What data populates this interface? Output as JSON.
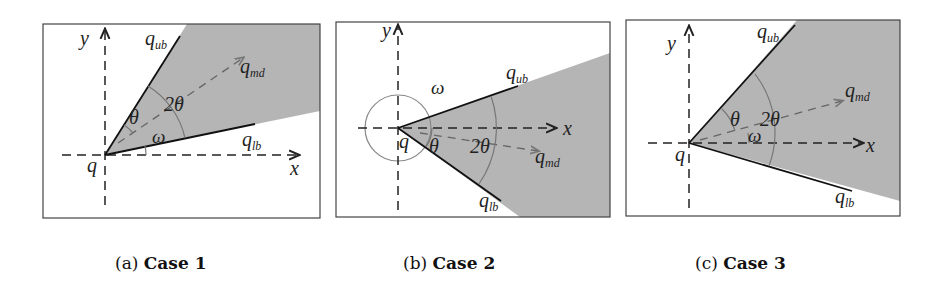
{
  "colors": {
    "shade": "#b5b5b5",
    "frame": "#444444",
    "ray": "#111111",
    "arc": "#777777",
    "dash": "#222222"
  },
  "panels": [
    {
      "id": "a",
      "caption_prefix": "(a)",
      "caption_title": "Case 1",
      "labels": {
        "y": "y",
        "x": "x",
        "q": "q",
        "ub": "q",
        "ub_sub": "ub",
        "md": "q",
        "md_sub": "md",
        "lb": "q",
        "lb_sub": "lb",
        "theta": "θ",
        "two_theta": "2θ",
        "omega": "ω"
      }
    },
    {
      "id": "b",
      "caption_prefix": "(b)",
      "caption_title": "Case 2",
      "labels": {
        "y": "y",
        "x": "x",
        "q": "q",
        "ub": "q",
        "ub_sub": "ub",
        "md": "q",
        "md_sub": "md",
        "lb": "q",
        "lb_sub": "lb",
        "theta": "θ",
        "two_theta": "2θ",
        "omega": "ω"
      }
    },
    {
      "id": "c",
      "caption_prefix": "(c)",
      "caption_title": "Case 3",
      "labels": {
        "y": "y",
        "x": "x",
        "q": "q",
        "ub": "q",
        "ub_sub": "ub",
        "md": "q",
        "md_sub": "md",
        "lb": "q",
        "lb_sub": "lb",
        "theta": "θ",
        "two_theta": "2θ",
        "omega": "ω"
      }
    }
  ]
}
